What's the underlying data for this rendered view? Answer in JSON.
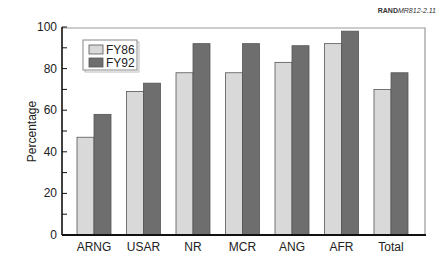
{
  "source_ref": {
    "bold": "RAND",
    "rest": "MR812-2.11"
  },
  "colors": {
    "fy86": "#d9d9d9",
    "fy92": "#6e6e6e",
    "bar_stroke": "#555555",
    "axis": "#111111",
    "frame": "#999999"
  },
  "chart_data": {
    "type": "bar",
    "title": "",
    "xlabel": "",
    "ylabel": "Percentage",
    "ylim": [
      0,
      100
    ],
    "yticks": [
      0,
      20,
      40,
      60,
      80,
      100
    ],
    "grid": false,
    "legend_position": "upper-left inside",
    "categories": [
      "ARNG",
      "USAR",
      "NR",
      "MCR",
      "ANG",
      "AFR",
      "Total"
    ],
    "series": [
      {
        "name": "FY86",
        "values": [
          47,
          69,
          78,
          78,
          83,
          92,
          70
        ]
      },
      {
        "name": "FY92",
        "values": [
          58,
          73,
          92,
          92,
          91,
          98,
          78
        ]
      }
    ]
  }
}
